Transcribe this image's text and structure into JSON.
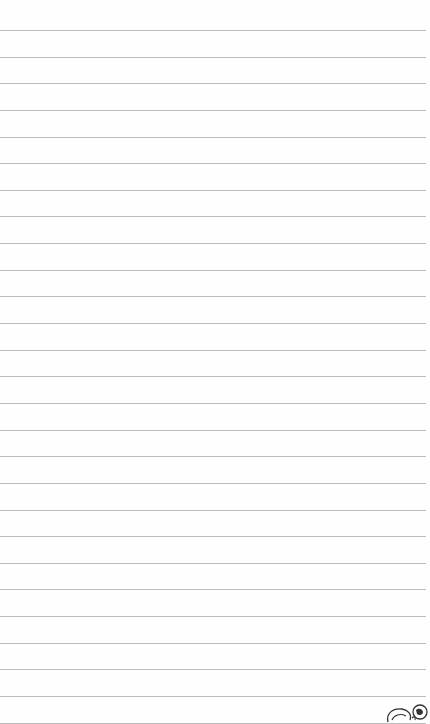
{
  "page": {
    "type": "lined-notepaper",
    "background_color": "#fefefe",
    "rule_color": "#bdbdbd",
    "first_rule_y": 30,
    "rule_spacing": 26.64,
    "rule_count": 27
  },
  "doodle": {
    "icon": "cartoon-doodle-icon",
    "stroke_color": "#333333"
  }
}
